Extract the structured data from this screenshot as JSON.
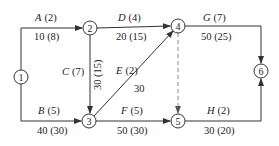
{
  "diagram": {
    "type": "activity-network",
    "nodes": [
      {
        "id": "1",
        "label": "1",
        "x": 21,
        "y": 77
      },
      {
        "id": "2",
        "label": "2",
        "x": 90,
        "y": 28
      },
      {
        "id": "3",
        "label": "3",
        "x": 89,
        "y": 121
      },
      {
        "id": "4",
        "label": "4",
        "x": 178,
        "y": 26
      },
      {
        "id": "5",
        "label": "5",
        "x": 178,
        "y": 121
      },
      {
        "id": "6",
        "label": "6",
        "x": 261,
        "y": 71
      }
    ],
    "edges": [
      {
        "name": "A",
        "duration": "(2)",
        "cost": "10",
        "cost_paren": "(8)",
        "from": "1",
        "to": "2",
        "top": "A (2)",
        "bottom": "10 (8)"
      },
      {
        "name": "B",
        "duration": "(5)",
        "cost": "40",
        "cost_paren": "(30)",
        "from": "1",
        "to": "3",
        "top": "B (5)",
        "bottom": "40 (30)"
      },
      {
        "name": "C",
        "duration": "(7)",
        "cost": "30",
        "cost_paren": "(15)",
        "from": "2",
        "to": "3",
        "top": "C (7)",
        "bottom": "30 (15)"
      },
      {
        "name": "D",
        "duration": "(4)",
        "cost": "20",
        "cost_paren": "(15)",
        "from": "2",
        "to": "4",
        "top": "D (4)",
        "bottom": "20 (15)"
      },
      {
        "name": "E",
        "duration": "(2)",
        "cost": "30",
        "from": "3",
        "to": "4",
        "top": "E (2)",
        "bottom": "30"
      },
      {
        "name": "F",
        "duration": "(5)",
        "cost": "50",
        "cost_paren": "(30)",
        "from": "3",
        "to": "5",
        "top": "F (5)",
        "bottom": "50 (30)"
      },
      {
        "name": "G",
        "duration": "(7)",
        "cost": "50",
        "cost_paren": "(25)",
        "from": "4",
        "to": "6",
        "top": "G (7)",
        "bottom": "50 (25)"
      },
      {
        "name": "H",
        "duration": "(2)",
        "cost": "30",
        "cost_paren": "(20)",
        "from": "5",
        "to": "6",
        "top": "H (2)",
        "bottom": "30 (20)"
      },
      {
        "name": "dummy",
        "from": "4",
        "to": "5",
        "style": "dashed"
      }
    ],
    "colors": {
      "line": "#333333",
      "dummy": "#999999",
      "text": "#222222"
    }
  }
}
